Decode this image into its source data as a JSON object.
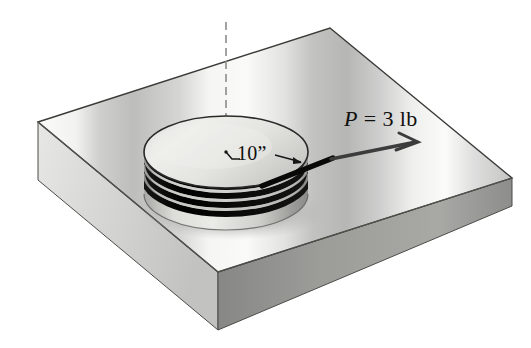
{
  "figure": {
    "kind": "engineering-mechanics-diagram",
    "background_color": "#ffffff"
  },
  "labels": {
    "force": {
      "symbol": "P",
      "relation": "=",
      "magnitude": "3",
      "unit": "lb",
      "full_text": "P = 3 lb",
      "name": "applied-force-label"
    },
    "diameter": {
      "value": "10",
      "unit_mark": "”",
      "full_text": "10”",
      "name": "drum-diameter-label"
    }
  },
  "geometry": {
    "plate": {
      "top_face_points": "38,122 330,28 512,178 218,272",
      "left_face_points": "38,122 218,272 218,330 38,180",
      "right_face_points": "218,272 512,178 512,206 218,330",
      "outline_color": "#3a3a38",
      "top_light": "#f3f3f1",
      "top_mid": "#d8d8d6",
      "top_dark": "#b4b4b2",
      "side_left": "#d3d3d1",
      "side_right": "#8f8f8d"
    },
    "drum": {
      "center_x": 226,
      "center_y": 152,
      "radius_x": 82,
      "radius_y": 36,
      "body_height": 42,
      "top_face_light": "#e9e9e6",
      "top_face_shade": "#c8c8c5",
      "side_light": "#e2e2df",
      "side_dark": "#9e9e9b",
      "cord_color": "#0c0c0a",
      "cord_turns": 4
    },
    "axis": {
      "x": 226,
      "y_top": 22,
      "y_bottom": 152,
      "color": "#8c8c8a",
      "dash": "7 5",
      "name": "vertical-center-axis"
    },
    "cord_tail": {
      "from_x": 268,
      "from_y": 182,
      "to_x": 332,
      "to_y": 158,
      "color": "#0c0c0a"
    },
    "force_arrow": {
      "tail_x": 332,
      "tail_y": 158,
      "tip_x": 417,
      "tip_y": 142,
      "color": "#39393a",
      "head_style": "open-v"
    },
    "dimension_leader": {
      "center_dot_x": 226,
      "center_dot_y": 152,
      "elbow_x": 236,
      "elbow_y": 160,
      "arrow_from_x": 274,
      "arrow_from_y": 156,
      "arrow_to_x": 300,
      "arrow_to_y": 162,
      "color": "#1d1d1b"
    },
    "shadow": {
      "center_x": 232,
      "center_y": 214,
      "radius_x": 92,
      "radius_y": 26,
      "color": "#9a9a97"
    }
  }
}
